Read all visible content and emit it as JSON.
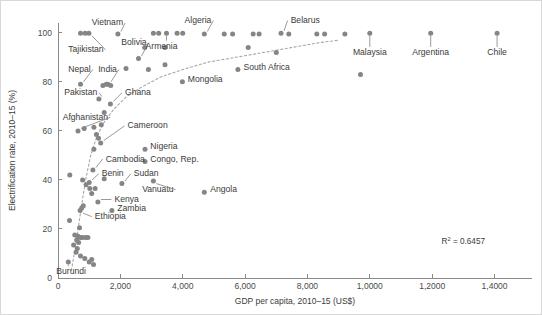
{
  "chart_data": {
    "type": "scatter",
    "title": "",
    "xlabel": "GDP per capita, 2010–15 (US$)",
    "ylabel": "Electrification rate, 2010–15 (%)",
    "xlim": [
      0,
      15200
    ],
    "ylim": [
      0,
      104
    ],
    "grid": false,
    "legend": "none",
    "xticks": [
      0,
      2000,
      4000,
      6000,
      8000,
      10000,
      12000,
      14000
    ],
    "xtick_labels": [
      "0",
      "2,000",
      "4,000",
      "6,000",
      "8,000",
      "1,0000",
      "1,2000",
      "1,4000"
    ],
    "yticks": [
      0,
      20,
      40,
      60,
      80,
      100
    ],
    "ytick_labels": [
      "0",
      "20",
      "40",
      "60",
      "80",
      "100"
    ],
    "annotations": [
      {
        "text": "R² = 0.6457",
        "x": 12300,
        "y": 14
      }
    ],
    "r2_label_prefix": "R",
    "r2_label_sup": "2",
    "r2_label_value": " = 0.6457",
    "marker_color": "#858585",
    "trendline": {
      "style": "dashed",
      "color": "#a8a8a8",
      "description": "logarithmic fit rising from low GDP/low electrification to ~100% near 9,000 US$",
      "points": [
        [
          430,
          3
        ],
        [
          600,
          16
        ],
        [
          760,
          30
        ],
        [
          900,
          41
        ],
        [
          1050,
          50
        ],
        [
          1250,
          58
        ],
        [
          1500,
          64
        ],
        [
          1800,
          69
        ],
        [
          2200,
          74
        ],
        [
          2700,
          78
        ],
        [
          3300,
          82
        ],
        [
          4000,
          85
        ],
        [
          4800,
          88
        ],
        [
          5700,
          90
        ],
        [
          6600,
          92
        ],
        [
          7500,
          94
        ],
        [
          8400,
          96
        ],
        [
          9000,
          97
        ]
      ]
    },
    "labeled_points": [
      {
        "name": "Vietnam",
        "x": 1920,
        "y": 99.5,
        "label_x": 1080,
        "label_y": 103
      },
      {
        "name": "Tajikistan",
        "x": 990,
        "y": 99.8,
        "label_x": 330,
        "label_y": 92
      },
      {
        "name": "Bolivia",
        "x": 2580,
        "y": 89.5,
        "label_x": 2030,
        "label_y": 95
      },
      {
        "name": "Algeria",
        "x": 4690,
        "y": 99.5,
        "label_x": 4060,
        "label_y": 104
      },
      {
        "name": "Armenia",
        "x": 3480,
        "y": 99.8,
        "label_x": 3320,
        "label_y": 93.5
      },
      {
        "name": "Belarus",
        "x": 7150,
        "y": 99.8,
        "label_x": 7460,
        "label_y": 104
      },
      {
        "name": "Nepal",
        "x": 720,
        "y": 79,
        "label_x": 330,
        "label_y": 84
      },
      {
        "name": "India",
        "x": 1600,
        "y": 79,
        "label_x": 1290,
        "label_y": 84
      },
      {
        "name": "Pakistan",
        "x": 1310,
        "y": 73,
        "label_x": 200,
        "label_y": 74.5
      },
      {
        "name": "Ghana",
        "x": 1680,
        "y": 71,
        "label_x": 2150,
        "label_y": 74.5
      },
      {
        "name": "Mongolia",
        "x": 3990,
        "y": 80,
        "label_x": 4160,
        "label_y": 80
      },
      {
        "name": "South Africa",
        "x": 5770,
        "y": 85,
        "label_x": 5950,
        "label_y": 85
      },
      {
        "name": "Afghanistan",
        "x": 640,
        "y": 60,
        "label_x": 150,
        "label_y": 64.5
      },
      {
        "name": "Cameroon",
        "x": 1370,
        "y": 55,
        "label_x": 2230,
        "label_y": 61
      },
      {
        "name": "Nigeria",
        "x": 2790,
        "y": 52.5,
        "label_x": 2960,
        "label_y": 52.5
      },
      {
        "name": "Congo, Rep.",
        "x": 2790,
        "y": 47.5,
        "label_x": 2960,
        "label_y": 47.5
      },
      {
        "name": "Cambodia",
        "x": 1120,
        "y": 44,
        "label_x": 1530,
        "label_y": 47.5
      },
      {
        "name": "Benin",
        "x": 1000,
        "y": 39,
        "label_x": 1400,
        "label_y": 41.5
      },
      {
        "name": "Sudan",
        "x": 2050,
        "y": 38.5,
        "label_x": 2430,
        "label_y": 41.5
      },
      {
        "name": "Vanuatu",
        "x": 3060,
        "y": 39.5,
        "label_x": 2700,
        "label_y": 35
      },
      {
        "name": "Angola",
        "x": 4690,
        "y": 35,
        "label_x": 4880,
        "label_y": 35
      },
      {
        "name": "Kenya",
        "x": 1280,
        "y": 31,
        "label_x": 1810,
        "label_y": 31
      },
      {
        "name": "Zambia",
        "x": 1730,
        "y": 27.5,
        "label_x": 1900,
        "label_y": 27.5
      },
      {
        "name": "Ethiopia",
        "x": 710,
        "y": 27.5,
        "label_x": 1180,
        "label_y": 24
      },
      {
        "name": "Malaysia",
        "x": 10000,
        "y": 99.8,
        "label_x": 10000,
        "label_y": 91
      },
      {
        "name": "Argentina",
        "x": 11950,
        "y": 99.8,
        "label_x": 11950,
        "label_y": 91
      },
      {
        "name": "Chile",
        "x": 14080,
        "y": 99.8,
        "label_x": 14080,
        "label_y": 91
      },
      {
        "name": "Burundi",
        "x": 330,
        "y": 6.5,
        "label_x": 420,
        "label_y": 1.5
      }
    ],
    "unlabeled_points": [
      [
        720,
        99.8
      ],
      [
        870,
        99.8
      ],
      [
        1920,
        99.5
      ],
      [
        3060,
        99.8
      ],
      [
        3230,
        99.8
      ],
      [
        3480,
        99.8
      ],
      [
        3820,
        99.8
      ],
      [
        4000,
        99.8
      ],
      [
        4690,
        99.5
      ],
      [
        5330,
        99.5
      ],
      [
        5600,
        99.5
      ],
      [
        6260,
        99.5
      ],
      [
        6450,
        99.5
      ],
      [
        7150,
        99.8
      ],
      [
        7400,
        99.5
      ],
      [
        8300,
        99.5
      ],
      [
        8550,
        99.5
      ],
      [
        9200,
        99.5
      ],
      [
        2780,
        94
      ],
      [
        3430,
        94
      ],
      [
        2580,
        89.5
      ],
      [
        3430,
        87
      ],
      [
        2180,
        85.5
      ],
      [
        2900,
        85
      ],
      [
        5770,
        85
      ],
      [
        9700,
        83
      ],
      [
        1550,
        79
      ],
      [
        1440,
        78.5
      ],
      [
        1690,
        78.5
      ],
      [
        720,
        79
      ],
      [
        3990,
        80
      ],
      [
        1310,
        73
      ],
      [
        1680,
        71
      ],
      [
        7000,
        92
      ],
      [
        6100,
        94
      ],
      [
        1480,
        67.5
      ],
      [
        1390,
        62.5
      ],
      [
        1150,
        61.5
      ],
      [
        840,
        61
      ],
      [
        640,
        60
      ],
      [
        1370,
        55
      ],
      [
        1300,
        57
      ],
      [
        1230,
        58.5
      ],
      [
        1150,
        52.5
      ],
      [
        2790,
        52.5
      ],
      [
        2790,
        47.5
      ],
      [
        1120,
        44
      ],
      [
        380,
        42
      ],
      [
        1000,
        39
      ],
      [
        1480,
        40.5
      ],
      [
        2050,
        38.5
      ],
      [
        3060,
        39.5
      ],
      [
        4690,
        35
      ],
      [
        790,
        40
      ],
      [
        1020,
        36.5
      ],
      [
        1190,
        36.5
      ],
      [
        900,
        38
      ],
      [
        1080,
        34.5
      ],
      [
        1280,
        31
      ],
      [
        1730,
        27.5
      ],
      [
        710,
        27.5
      ],
      [
        760,
        28.5
      ],
      [
        810,
        29.5
      ],
      [
        370,
        23.5
      ],
      [
        690,
        20.5
      ],
      [
        640,
        17
      ],
      [
        720,
        16.5
      ],
      [
        780,
        16.5
      ],
      [
        880,
        16.5
      ],
      [
        960,
        16.5
      ],
      [
        600,
        15.5
      ],
      [
        660,
        14.5
      ],
      [
        620,
        12
      ],
      [
        580,
        10.5
      ],
      [
        720,
        9
      ],
      [
        860,
        8
      ],
      [
        1000,
        6.5
      ],
      [
        1080,
        7.5
      ],
      [
        1140,
        5.5
      ],
      [
        330,
        6.5
      ],
      [
        500,
        13.5
      ],
      [
        540,
        17.5
      ]
    ]
  },
  "figure": {
    "background": "#ffffff",
    "border_color": "#d8d8d8"
  }
}
